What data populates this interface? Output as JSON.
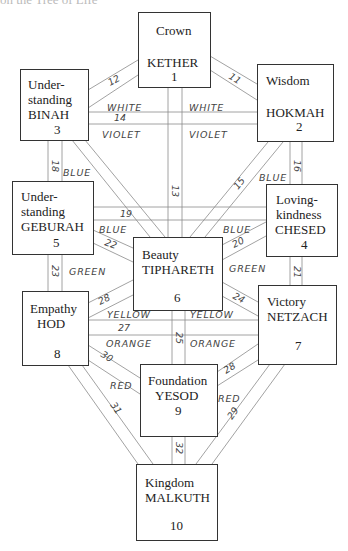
{
  "title_fragment": "on the Tree of Life",
  "nodes": {
    "kether": {
      "virtue": "Crown",
      "name": "KETHER",
      "number": "1"
    },
    "hokmah": {
      "virtue": "Wisdom",
      "name": "HOKMAH",
      "number": "2"
    },
    "binah": {
      "virtue_1": "Under-",
      "virtue_2": "standing",
      "name": "BINAH",
      "number": "3"
    },
    "chesed": {
      "virtue_1": "Loving-",
      "virtue_2": "kindness",
      "name": "CHESED",
      "number": "4"
    },
    "geburah": {
      "virtue_1": "Under-",
      "virtue_2": "standing",
      "name": "GEBURAH",
      "number": "5"
    },
    "tiphareth": {
      "virtue": "Beauty",
      "name": "TIPHARETH",
      "number": "6"
    },
    "netzach": {
      "virtue": "Victory",
      "name": "NETZACH",
      "number": "7"
    },
    "hod": {
      "virtue": "Empathy",
      "name": "HOD",
      "number": "8"
    },
    "yesod": {
      "virtue": "Foundation",
      "name": "YESOD",
      "number": "9"
    },
    "malkuth": {
      "virtue": "Kingdom",
      "name": "MALKUTH",
      "number": "10"
    }
  },
  "paths": [
    {
      "number": "11",
      "from": "kether",
      "to": "hokmah"
    },
    {
      "number": "12",
      "from": "kether",
      "to": "binah"
    },
    {
      "number": "13",
      "from": "kether",
      "to": "tiphareth"
    },
    {
      "number": "14",
      "from": "binah",
      "to": "hokmah"
    },
    {
      "number": "15",
      "from": "hokmah",
      "to": "tiphareth"
    },
    {
      "number": "16",
      "from": "hokmah",
      "to": "chesed"
    },
    {
      "number": "18",
      "from": "binah",
      "to": "geburah"
    },
    {
      "number": "19",
      "from": "geburah",
      "to": "chesed"
    },
    {
      "number": "20",
      "from": "chesed",
      "to": "tiphareth"
    },
    {
      "number": "21",
      "from": "chesed",
      "to": "netzach"
    },
    {
      "number": "22",
      "from": "geburah",
      "to": "tiphareth"
    },
    {
      "number": "23",
      "from": "geburah",
      "to": "hod"
    },
    {
      "number": "24",
      "from": "tiphareth",
      "to": "netzach"
    },
    {
      "number": "25",
      "from": "tiphareth",
      "to": "yesod"
    },
    {
      "number": "26",
      "from": "tiphareth",
      "to": "hod"
    },
    {
      "number": "27",
      "from": "hod",
      "to": "netzach"
    },
    {
      "number": "28",
      "from": "netzach",
      "to": "yesod"
    },
    {
      "number": "29",
      "from": "netzach",
      "to": "malkuth"
    },
    {
      "number": "30",
      "from": "hod",
      "to": "yesod"
    },
    {
      "number": "31",
      "from": "hod",
      "to": "malkuth"
    },
    {
      "number": "32",
      "from": "yesod",
      "to": "malkuth"
    }
  ],
  "colors": {
    "white_left": "WHITE",
    "white_right": "WHITE",
    "violet_left": "VIOLET",
    "violet_right": "VIOLET",
    "blue_18": "BLUE",
    "blue_16": "BLUE",
    "blue_22": "BLUE",
    "blue_20": "BLUE",
    "green_left": "GREEN",
    "green_right": "GREEN",
    "yellow_left": "YELLOW",
    "yellow_right": "YELLOW",
    "orange_left": "ORANGE",
    "orange_right": "ORANGE",
    "red_left": "RED",
    "red_right": "RED"
  }
}
